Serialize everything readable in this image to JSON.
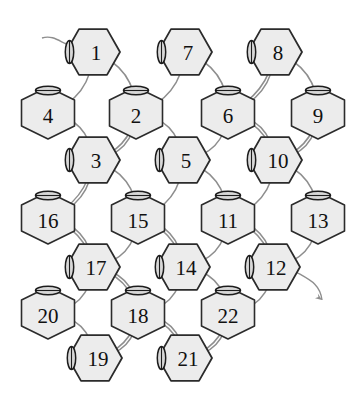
{
  "diagram": {
    "node_count": 22,
    "node_fill": "#ececec",
    "node_stroke": "#2b2b2b",
    "edge_color": "#8e8e8e",
    "background": "#ffffff",
    "input_arrow_label": "",
    "output_arrow_label": "",
    "nodes": [
      {
        "id": "n1",
        "label": "1",
        "cx": 93,
        "cy": 52,
        "shape": "pointy-left"
      },
      {
        "id": "n2",
        "label": "2",
        "cx": 136,
        "cy": 113,
        "shape": "flat-top"
      },
      {
        "id": "n3",
        "label": "3",
        "cx": 93,
        "cy": 160,
        "shape": "pointy-left"
      },
      {
        "id": "n4",
        "label": "4",
        "cx": 48,
        "cy": 113,
        "shape": "flat-top"
      },
      {
        "id": "n5",
        "label": "5",
        "cx": 183,
        "cy": 160,
        "shape": "pointy-left"
      },
      {
        "id": "n6",
        "label": "6",
        "cx": 228,
        "cy": 113,
        "shape": "flat-top"
      },
      {
        "id": "n7",
        "label": "7",
        "cx": 185,
        "cy": 52,
        "shape": "pointy-left"
      },
      {
        "id": "n8",
        "label": "8",
        "cx": 275,
        "cy": 52,
        "shape": "pointy-left"
      },
      {
        "id": "n9",
        "label": "9",
        "cx": 318,
        "cy": 113,
        "shape": "flat-top"
      },
      {
        "id": "n10",
        "label": "10",
        "cx": 275,
        "cy": 160,
        "shape": "pointy-left"
      },
      {
        "id": "n11",
        "label": "11",
        "cx": 228,
        "cy": 218,
        "shape": "flat-top"
      },
      {
        "id": "n12",
        "label": "12",
        "cx": 273,
        "cy": 267,
        "shape": "pointy-left"
      },
      {
        "id": "n13",
        "label": "13",
        "cx": 318,
        "cy": 218,
        "shape": "flat-top"
      },
      {
        "id": "n14",
        "label": "14",
        "cx": 183,
        "cy": 267,
        "shape": "pointy-left"
      },
      {
        "id": "n15",
        "label": "15",
        "cx": 138,
        "cy": 218,
        "shape": "flat-top"
      },
      {
        "id": "n16",
        "label": "16",
        "cx": 48,
        "cy": 218,
        "shape": "flat-top"
      },
      {
        "id": "n17",
        "label": "17",
        "cx": 93,
        "cy": 267,
        "shape": "pointy-left"
      },
      {
        "id": "n18",
        "label": "18",
        "cx": 138,
        "cy": 313,
        "shape": "flat-top"
      },
      {
        "id": "n19",
        "label": "19",
        "cx": 95,
        "cy": 358,
        "shape": "pointy-left"
      },
      {
        "id": "n20",
        "label": "20",
        "cx": 48,
        "cy": 313,
        "shape": "flat-top"
      },
      {
        "id": "n21",
        "label": "21",
        "cx": 185,
        "cy": 358,
        "shape": "pointy-left"
      },
      {
        "id": "n22",
        "label": "22",
        "cx": 228,
        "cy": 313,
        "shape": "flat-top"
      }
    ],
    "edges": [
      {
        "from": "n1",
        "to": "n4",
        "bow": -26
      },
      {
        "from": "n4",
        "to": "n3",
        "bow": -26
      },
      {
        "from": "n1",
        "to": "n2",
        "bow": -26
      },
      {
        "from": "n2",
        "to": "n3",
        "bow": -26
      },
      {
        "from": "n2",
        "to": "n3",
        "bow": -20
      },
      {
        "from": "n2",
        "to": "n5",
        "bow": -26
      },
      {
        "from": "n7",
        "to": "n2",
        "bow": -26
      },
      {
        "from": "n7",
        "to": "n6",
        "bow": -26
      },
      {
        "from": "n6",
        "to": "n5",
        "bow": -26
      },
      {
        "from": "n6",
        "to": "n10",
        "bow": -26
      },
      {
        "from": "n6",
        "to": "n10",
        "bow": -20
      },
      {
        "from": "n8",
        "to": "n6",
        "bow": -26
      },
      {
        "from": "n8",
        "to": "n6",
        "bow": -20
      },
      {
        "from": "n8",
        "to": "n9",
        "bow": -26
      },
      {
        "from": "n9",
        "to": "n10",
        "bow": -26
      },
      {
        "from": "n9",
        "to": "n10",
        "bow": -20
      },
      {
        "from": "n3",
        "to": "n16",
        "bow": -26
      },
      {
        "from": "n3",
        "to": "n16",
        "bow": -20
      },
      {
        "from": "n3",
        "to": "n15",
        "bow": -26
      },
      {
        "from": "n5",
        "to": "n15",
        "bow": -26
      },
      {
        "from": "n5",
        "to": "n11",
        "bow": -26
      },
      {
        "from": "n10",
        "to": "n11",
        "bow": -26
      },
      {
        "from": "n10",
        "to": "n13",
        "bow": -26
      },
      {
        "from": "n16",
        "to": "n17",
        "bow": -26
      },
      {
        "from": "n16",
        "to": "n17",
        "bow": -20
      },
      {
        "from": "n15",
        "to": "n17",
        "bow": -26
      },
      {
        "from": "n15",
        "to": "n14",
        "bow": -26
      },
      {
        "from": "n15",
        "to": "n14",
        "bow": -20
      },
      {
        "from": "n11",
        "to": "n14",
        "bow": -26
      },
      {
        "from": "n11",
        "to": "n12",
        "bow": -26
      },
      {
        "from": "n11",
        "to": "n12",
        "bow": -20
      },
      {
        "from": "n13",
        "to": "n12",
        "bow": -26
      },
      {
        "from": "n17",
        "to": "n20",
        "bow": -26
      },
      {
        "from": "n17",
        "to": "n18",
        "bow": -26
      },
      {
        "from": "n17",
        "to": "n18",
        "bow": -20
      },
      {
        "from": "n14",
        "to": "n18",
        "bow": -26
      },
      {
        "from": "n14",
        "to": "n22",
        "bow": -26
      },
      {
        "from": "n12",
        "to": "n22",
        "bow": -26
      },
      {
        "from": "n20",
        "to": "n19",
        "bow": -26
      },
      {
        "from": "n18",
        "to": "n19",
        "bow": -26
      },
      {
        "from": "n18",
        "to": "n19",
        "bow": -20
      },
      {
        "from": "n18",
        "to": "n21",
        "bow": -26
      },
      {
        "from": "n18",
        "to": "n21",
        "bow": -20
      },
      {
        "from": "n22",
        "to": "n21",
        "bow": -26
      },
      {
        "from": "n22",
        "to": "n21",
        "bow": -20
      }
    ],
    "io": {
      "input": {
        "x1": 42,
        "y1": 38,
        "x2": 72,
        "y2": 46,
        "target": "n1"
      },
      "output": {
        "x1": 296,
        "y1": 272,
        "x2": 322,
        "y2": 300,
        "source": "n12"
      }
    }
  }
}
